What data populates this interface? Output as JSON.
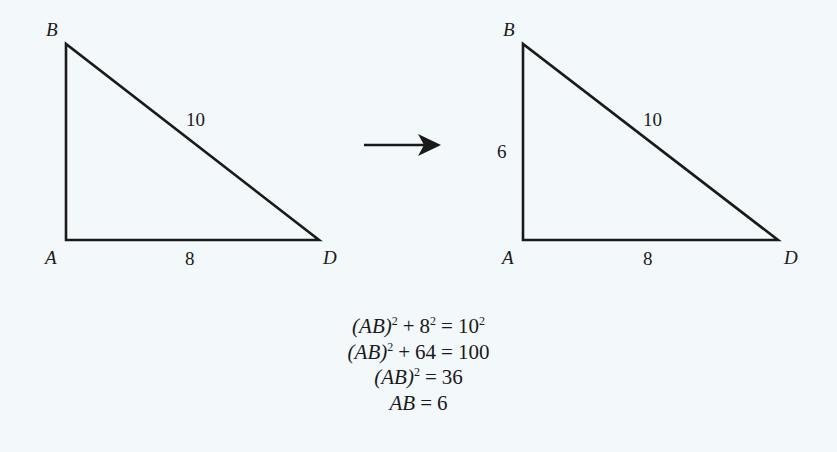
{
  "diagram": {
    "left_triangle": {
      "vertices": {
        "A": "A",
        "B": "B",
        "D": "D"
      },
      "sides": {
        "BD": "10",
        "AD": "8"
      }
    },
    "arrow": "right-arrow",
    "right_triangle": {
      "vertices": {
        "A": "A",
        "B": "B",
        "D": "D"
      },
      "sides": {
        "AB": "6",
        "BD": "10",
        "AD": "8"
      }
    },
    "colors": {
      "background": "#f3f8fb",
      "stroke": "#1a1a1a"
    }
  },
  "equations": [
    {
      "lhs_var": "(AB)",
      "lhs_exp": "2",
      "plus": "+",
      "term": "8",
      "term_exp": "2",
      "eq": "=",
      "rhs": "10",
      "rhs_exp": "2"
    },
    {
      "lhs_var": "(AB)",
      "lhs_exp": "2",
      "plus": "+",
      "term": "64",
      "eq": "=",
      "rhs": "100"
    },
    {
      "lhs_var": "(AB)",
      "lhs_exp": "2",
      "eq": "=",
      "rhs": "36"
    },
    {
      "lhs_var": "AB",
      "eq": "=",
      "rhs": "6"
    }
  ]
}
